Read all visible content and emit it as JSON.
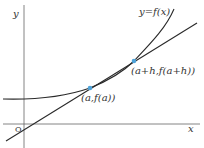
{
  "diagram": {
    "function_label": "y=f(x)",
    "axis_x_label": "x",
    "axis_y_label": "y",
    "origin_label": "O",
    "point_a_label": "(a,f(a))",
    "point_b_label": "(a+h,f(a+h))",
    "colors": {
      "line": "#2a2a2a",
      "axis": "#555555",
      "point": "#4fa3d9"
    }
  }
}
